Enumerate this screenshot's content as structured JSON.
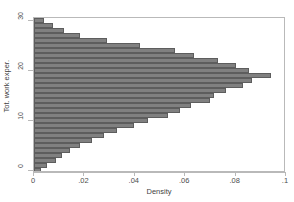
{
  "chart_data": {
    "type": "bar",
    "orientation": "horizontal",
    "title": "",
    "subtitle": "",
    "xlabel": "Density",
    "ylabel": "Tot. work exper.",
    "xlim": [
      0,
      0.1
    ],
    "ylim": [
      -0.5,
      30.5
    ],
    "grid": false,
    "legend": null,
    "bar_color": "#808080",
    "bar_edge_color": "#5d5d5d",
    "frame_color": "#b9b9b9",
    "xticks": [
      0,
      0.02,
      0.04,
      0.06,
      0.08,
      0.1
    ],
    "xticklabels": [
      "0",
      ".02",
      ".04",
      ".06",
      ".08",
      ".1"
    ],
    "yticks": [
      0,
      10,
      20,
      30
    ],
    "yticklabels": [
      "0",
      "10",
      "20",
      "30"
    ],
    "categories": [
      0,
      1,
      2,
      3,
      4,
      5,
      6,
      7,
      8,
      9,
      10,
      11,
      12,
      13,
      14,
      15,
      16,
      17,
      18,
      19,
      20,
      21,
      22,
      23,
      24,
      25,
      26,
      27,
      28,
      29,
      30
    ],
    "values": [
      0.0027,
      0.0053,
      0.0088,
      0.0113,
      0.0142,
      0.0181,
      0.0231,
      0.0276,
      0.033,
      0.0398,
      0.0452,
      0.053,
      0.058,
      0.0622,
      0.07,
      0.0716,
      0.076,
      0.083,
      0.0866,
      0.094,
      0.0855,
      0.08,
      0.073,
      0.0636,
      0.056,
      0.042,
      0.029,
      0.0182,
      0.012,
      0.0075,
      0.0041
    ]
  }
}
